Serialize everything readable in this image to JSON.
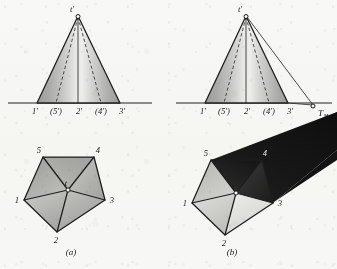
{
  "figure": {
    "panels": [
      {
        "id": "a",
        "caption": "(a)",
        "elevation": {
          "apex_label": "t'",
          "ground_labels": [
            "1'",
            "(5')",
            "2'",
            "(4')",
            "3'"
          ]
        },
        "plan": {
          "center_label": "t",
          "vertex_labels": [
            "1",
            "2",
            "3",
            "4",
            "5"
          ]
        }
      },
      {
        "id": "b",
        "caption": "(b)",
        "elevation": {
          "apex_label": "t'",
          "ground_labels": [
            "1'",
            "(5')",
            "2'",
            "(4')",
            "3'"
          ],
          "shadow_point_label": "T",
          "shadow_point_subscript": "H"
        },
        "plan": {
          "center_label": "t",
          "vertex_labels": [
            "1",
            "2",
            "3",
            "4",
            "5"
          ]
        }
      }
    ],
    "colors": {
      "ink": "#1d1d1d",
      "paper": "#fbfbfa",
      "face_light": "#e8e8e6",
      "face_mid": "#b9b9b7",
      "face_dark": "#8e8e8c",
      "shadow_dark": "#141414",
      "shadow_mid": "#242424"
    }
  }
}
